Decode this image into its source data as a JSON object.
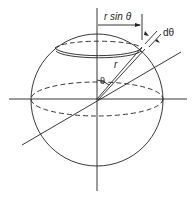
{
  "diagram": {
    "labels": {
      "r_sin_theta": "r sin θ",
      "d_theta": "dθ",
      "r": "r",
      "theta": "θ"
    },
    "colors": {
      "stroke": "#222222",
      "background": "#ffffff"
    }
  }
}
